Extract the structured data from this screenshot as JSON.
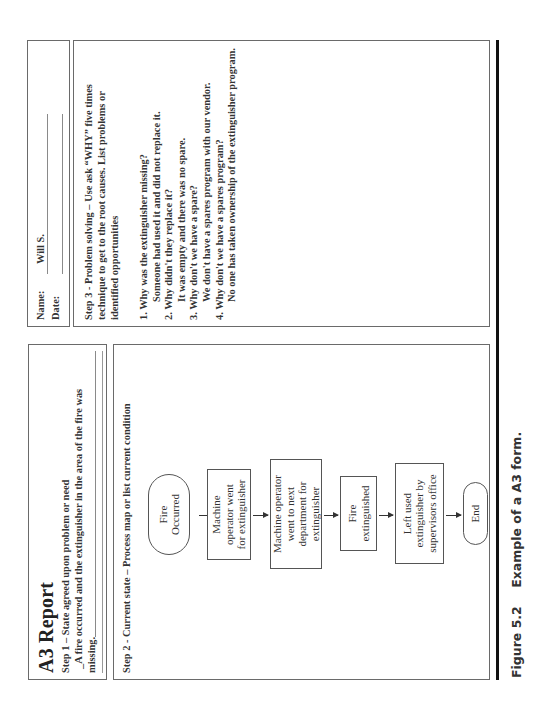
{
  "form": {
    "title": "A3 Report",
    "step1": {
      "label": "Step 1 – State agreed upon problem or need",
      "text_line1": "_A fire occurred and the extinguisher in the area of the fire was",
      "text_line2": "missing."
    },
    "step2": {
      "label": "Step 2 - Current state – Process map or list current condition",
      "flowchart": [
        {
          "shape": "terminal",
          "lines": [
            "Fire",
            "Occurred"
          ]
        },
        {
          "shape": "process",
          "lines": [
            "Machine",
            "operator went",
            "for extinguisher"
          ]
        },
        {
          "shape": "process",
          "lines": [
            "Machine operator",
            "went to next",
            "department for",
            "extinguisher"
          ]
        },
        {
          "shape": "process",
          "lines": [
            "Fire",
            "extinguished"
          ]
        },
        {
          "shape": "process",
          "lines": [
            "Left used",
            "extinguisher by",
            "supervisors office"
          ]
        },
        {
          "shape": "terminal",
          "lines": [
            "End"
          ]
        }
      ]
    },
    "header_right": {
      "name_label": "Name:",
      "name_value": "Will S.",
      "date_label": "Date:",
      "date_value": ""
    },
    "step3": {
      "label_line1": "Step 3 - Problem solving – Use ask “WHY” five times",
      "label_line2": "technique to get to the root causes.  List problems or",
      "label_line3": "identified opportunities",
      "whys": [
        {
          "q": "1. Why was the extinguisher missing?",
          "a": "Someone had used it and did not replace it."
        },
        {
          "q": "2. Why didn't they replace it?",
          "a": "It was empty and there was no spare."
        },
        {
          "q": "3. Why don't we have a spare?",
          "a": "We don't have a spares program with our vendor."
        },
        {
          "q": "4. Why don't we have a spares program?",
          "a": "No one has taken ownership of the extinguisher program."
        }
      ]
    }
  },
  "caption": {
    "figure_number": "Figure 5.2",
    "text": "Example of a A3 form."
  }
}
